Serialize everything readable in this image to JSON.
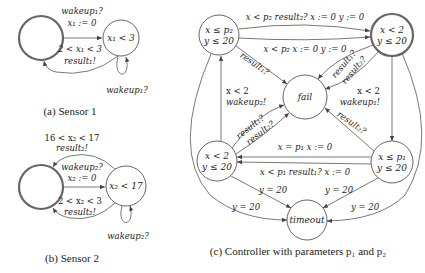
{
  "sensor1": {
    "caption": "(a) Sensor 1",
    "states": [
      {
        "id": "s1_idle",
        "label": "",
        "initial": true
      },
      {
        "id": "s1_active",
        "label": "x₁ < 3"
      }
    ],
    "edges": [
      {
        "from": "s1_idle",
        "to": "s1_active",
        "label_line1": "wakeup₁?",
        "label_line2": "x₁ := 0"
      },
      {
        "from": "s1_active",
        "to": "s1_idle",
        "label_line1": "2 < x₁ < 3",
        "label_line2": "result₁!"
      },
      {
        "from": "s1_active",
        "to": "s1_active",
        "label_line1": "wakeup₁?"
      }
    ]
  },
  "sensor2": {
    "caption": "(b) Sensor 2",
    "states": [
      {
        "id": "s2_idle",
        "label": "",
        "initial": true
      },
      {
        "id": "s2_active",
        "label": "x₂ < 17"
      }
    ],
    "edges": [
      {
        "from": "s2_active",
        "to": "s2_idle",
        "label_line1": "16 < x₂ < 17",
        "label_line2": "result₂!"
      },
      {
        "from": "s2_idle",
        "to": "s2_active",
        "label_line1": "wakeup₂?",
        "label_line2": "x₂ := 0"
      },
      {
        "from": "s2_active",
        "to": "s2_idle",
        "label_line1": "2 < x₂ < 3",
        "label_line2": "result₂!"
      },
      {
        "from": "s2_active",
        "to": "s2_active",
        "label_line1": "wakeup₂?"
      }
    ]
  },
  "controller": {
    "caption": "(c) Controller with parameters p₁ and p₂",
    "states": [
      {
        "id": "c_tl",
        "line1": "x ≤ p₂",
        "line2": "y ≤ 20"
      },
      {
        "id": "c_tr",
        "line1": "x < 2",
        "line2": "y ≤ 20",
        "initial": true
      },
      {
        "id": "c_bl",
        "line1": "x < 2",
        "line2": "y ≤ 20"
      },
      {
        "id": "c_br",
        "line1": "x ≤ p₁",
        "line2": "y ≤ 20"
      },
      {
        "id": "fail",
        "line1": "fail"
      },
      {
        "id": "timeout",
        "line1": "timeout"
      }
    ],
    "edges": [
      {
        "from": "c_tl",
        "to": "c_tr",
        "label": "x < p₂ result₂? x := 0 y := 0"
      },
      {
        "from": "c_tl",
        "to": "c_tr",
        "label": "x < p₂ x := 0 y := 0"
      },
      {
        "from": "c_tl",
        "to": "fail",
        "label": "result₁?"
      },
      {
        "from": "c_tr",
        "to": "fail",
        "label_line1": "result₁?",
        "label_line2": "result₂?"
      },
      {
        "from": "c_tr",
        "to": "c_br",
        "label_line1": "x < 2",
        "label_line2": "wakeup₁!"
      },
      {
        "from": "c_bl",
        "to": "c_tl",
        "label_line1": "x < 2",
        "label_line2": "wakeup₂!"
      },
      {
        "from": "c_bl",
        "to": "fail",
        "label_line1": "result₁?",
        "label_line2": "result₂?"
      },
      {
        "from": "c_br",
        "to": "fail",
        "label": "result₂?"
      },
      {
        "from": "c_br",
        "to": "c_bl",
        "label": "x = p₁ x := 0"
      },
      {
        "from": "c_br",
        "to": "c_bl",
        "label": "x < p₁ result₁? x := 0"
      },
      {
        "from": "c_bl",
        "to": "timeout",
        "label": "y = 20"
      },
      {
        "from": "c_br",
        "to": "timeout",
        "label": "y = 20"
      },
      {
        "from": "c_tl",
        "to": "timeout",
        "label": "y = 20"
      },
      {
        "from": "c_tr",
        "to": "timeout",
        "label": "y = 20"
      }
    ]
  }
}
